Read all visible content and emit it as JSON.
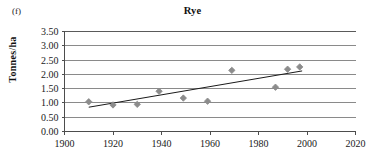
{
  "panel": {
    "label": "(f)"
  },
  "chart_data": {
    "type": "scatter",
    "title": "Rye",
    "xlabel": "",
    "ylabel": "Tonnes/ha",
    "xlim": [
      1900,
      2020
    ],
    "ylim": [
      0.0,
      3.5
    ],
    "xticks": [
      1900,
      1920,
      1940,
      1960,
      1980,
      2000,
      2020
    ],
    "xtick_labels": [
      "1900",
      "1920",
      "1940",
      "1960",
      "1980",
      "2000",
      "2020"
    ],
    "yticks": [
      0.0,
      0.5,
      1.0,
      1.5,
      2.0,
      2.5,
      3.0,
      3.5
    ],
    "ytick_labels": [
      "0.00",
      "0.50",
      "1.00",
      "1.50",
      "2.00",
      "2.50",
      "3.00",
      "3.50"
    ],
    "grid": "horizontal",
    "legend": "none",
    "marker_style": "diamond",
    "marker_color": "#8c8c8c",
    "trendline_color": "#1a1a1a",
    "series": [
      {
        "name": "Rye yield",
        "points": [
          {
            "x": 1910,
            "y": 1.04
          },
          {
            "x": 1920,
            "y": 0.93
          },
          {
            "x": 1930,
            "y": 0.95
          },
          {
            "x": 1939,
            "y": 1.41
          },
          {
            "x": 1949,
            "y": 1.17
          },
          {
            "x": 1959,
            "y": 1.06
          },
          {
            "x": 1969,
            "y": 2.14
          },
          {
            "x": 1987,
            "y": 1.55
          },
          {
            "x": 1992,
            "y": 2.18
          },
          {
            "x": 1997,
            "y": 2.26
          }
        ]
      }
    ],
    "trendline": {
      "x0": 1910,
      "y0": 0.85,
      "x1": 1998,
      "y1": 2.12
    }
  }
}
